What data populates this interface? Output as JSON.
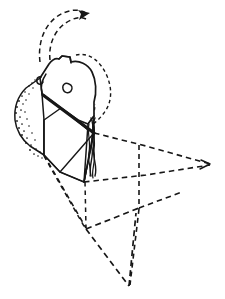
{
  "figure": {
    "domain": "Diagram",
    "title": "Lithic artifact technical illustration with geometric reconstruction",
    "caption": "",
    "background_color": "#ffffff",
    "ink_color": "#171717",
    "canvas": {
      "width": 225,
      "height": 299
    },
    "elements": [
      {
        "id": "motion-arrow",
        "name": "curved-motion-arrow",
        "style": "dashed double-line arc with solid filled arrowhead",
        "description": "Arc sweeping from the upper-left of the artifact over the top and terminating in an arrowhead pointing up-right",
        "label": ""
      },
      {
        "id": "artifact-body",
        "name": "artifact-outline",
        "style": "solid line",
        "description": "Faceted angular stone body occupying the upper-left of the frame",
        "label": ""
      },
      {
        "id": "cortex-band",
        "name": "stippled-cortex-band",
        "style": "stipple dots",
        "description": "Dotted texture band along the left flank indicating cortex / worn surface",
        "label": ""
      },
      {
        "id": "ring-mark",
        "name": "circular-scar-mark",
        "style": "small open circle",
        "description": "Small open ring on the upper facet marking a point of percussion",
        "label": ""
      },
      {
        "id": "arris-ridge",
        "name": "bold-ridge-line",
        "style": "heavy solid line",
        "description": "Thick diagonal ridge (arris) running from upper-left facet corner down-right to the junction node",
        "label": ""
      },
      {
        "id": "braid-feature",
        "name": "twisted-cord-feature",
        "style": "interlaced wavy solid lines",
        "description": "Vertical braided / rippled feature descending from the junction node",
        "label": ""
      },
      {
        "id": "projection-plane",
        "name": "dashed-projection-plane",
        "style": "dashed line",
        "description": "Dashed parallelogram plane extending right and downward from the artifact, representing the reconstructed flaking surface",
        "label": ""
      },
      {
        "id": "projection-pyramid",
        "name": "dashed-projection-pyramid",
        "style": "dashed line",
        "description": "Lower dashed triangular/pyramidal projection with vertical drop lines",
        "label": ""
      }
    ],
    "annotations": {
      "text_labels": [],
      "scale_bar": "",
      "figure_number": ""
    }
  }
}
